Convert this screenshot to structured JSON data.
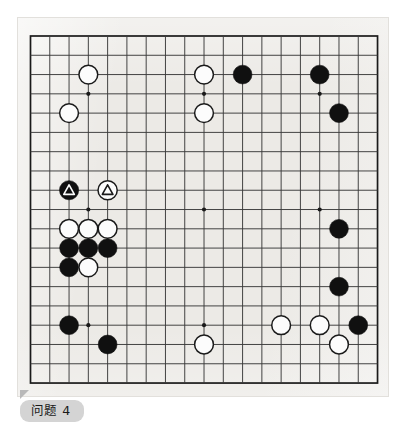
{
  "diagram": {
    "type": "go-board-problem",
    "caption": "问题 4",
    "board_size": 19,
    "colors": {
      "paper": "#eceae6",
      "line": "#3a3a3a",
      "border": "#1a1a1a",
      "black_stone": "#101010",
      "white_stone": "#fcfcfc",
      "white_stone_edge": "#1a1a1a",
      "caption_pill": "#d4d4d4",
      "caption_text": "#1a1a1a"
    },
    "geometry": {
      "origin_x": 30.5,
      "origin_y": 36.0,
      "step": 19.28,
      "stone_radius": 9.4,
      "marked_stone_radius": 9.6
    },
    "star_points": [
      {
        "col": 3,
        "row": 3
      },
      {
        "col": 9,
        "row": 3
      },
      {
        "col": 15,
        "row": 3
      },
      {
        "col": 3,
        "row": 9
      },
      {
        "col": 9,
        "row": 9
      },
      {
        "col": 15,
        "row": 9
      },
      {
        "col": 3,
        "row": 15
      },
      {
        "col": 9,
        "row": 15
      },
      {
        "col": 15,
        "row": 15
      }
    ],
    "stones": [
      {
        "id": "w-d17",
        "color": "white",
        "col": 3,
        "row": 2,
        "mark": null,
        "label": "White D17"
      },
      {
        "id": "w-c15",
        "color": "white",
        "col": 2,
        "row": 4,
        "mark": null,
        "label": "White C15"
      },
      {
        "id": "w-k17",
        "color": "white",
        "col": 9,
        "row": 2,
        "mark": null,
        "label": "White K17"
      },
      {
        "id": "b-m17",
        "color": "black",
        "col": 11,
        "row": 2,
        "mark": null,
        "label": "Black M17"
      },
      {
        "id": "w-k15",
        "color": "white",
        "col": 9,
        "row": 4,
        "mark": null,
        "label": "White K15"
      },
      {
        "id": "b-q17",
        "color": "black",
        "col": 15,
        "row": 2,
        "mark": null,
        "label": "Black Q17"
      },
      {
        "id": "b-r15",
        "color": "black",
        "col": 16,
        "row": 4,
        "mark": null,
        "label": "Black R15"
      },
      {
        "id": "b-c11-tri",
        "color": "black",
        "col": 2,
        "row": 8,
        "mark": "triangle",
        "label": "Black marked stone"
      },
      {
        "id": "w-e11-tri",
        "color": "white",
        "col": 4,
        "row": 8,
        "mark": "triangle",
        "label": "White marked stone"
      },
      {
        "id": "w-c9",
        "color": "white",
        "col": 2,
        "row": 10,
        "mark": null,
        "label": "White C9"
      },
      {
        "id": "w-d9",
        "color": "white",
        "col": 3,
        "row": 10,
        "mark": null,
        "label": "White D9"
      },
      {
        "id": "w-e9",
        "color": "white",
        "col": 4,
        "row": 10,
        "mark": null,
        "label": "White E9"
      },
      {
        "id": "b-c8",
        "color": "black",
        "col": 2,
        "row": 11,
        "mark": null,
        "label": "Black C8"
      },
      {
        "id": "b-d8",
        "color": "black",
        "col": 3,
        "row": 11,
        "mark": null,
        "label": "Black D8"
      },
      {
        "id": "b-e8",
        "color": "black",
        "col": 4,
        "row": 11,
        "mark": null,
        "label": "Black E8"
      },
      {
        "id": "b-c7",
        "color": "black",
        "col": 2,
        "row": 12,
        "mark": null,
        "label": "Black C7"
      },
      {
        "id": "w-d7",
        "color": "white",
        "col": 3,
        "row": 12,
        "mark": null,
        "label": "White D7"
      },
      {
        "id": "b-r9",
        "color": "black",
        "col": 16,
        "row": 10,
        "mark": null,
        "label": "Black R9"
      },
      {
        "id": "b-r6",
        "color": "black",
        "col": 16,
        "row": 13,
        "mark": null,
        "label": "Black R6"
      },
      {
        "id": "b-c4",
        "color": "black",
        "col": 2,
        "row": 15,
        "mark": null,
        "label": "Black C4"
      },
      {
        "id": "b-e3",
        "color": "black",
        "col": 4,
        "row": 16,
        "mark": null,
        "label": "Black E3"
      },
      {
        "id": "w-k3",
        "color": "white",
        "col": 9,
        "row": 16,
        "mark": null,
        "label": "White K3"
      },
      {
        "id": "w-o4",
        "color": "white",
        "col": 13,
        "row": 15,
        "mark": null,
        "label": "White O4"
      },
      {
        "id": "w-q4",
        "color": "white",
        "col": 15,
        "row": 15,
        "mark": null,
        "label": "White Q4"
      },
      {
        "id": "b-s4",
        "color": "black",
        "col": 17,
        "row": 15,
        "mark": null,
        "label": "Black S4"
      },
      {
        "id": "w-r3",
        "color": "white",
        "col": 16,
        "row": 16,
        "mark": null,
        "label": "White R3"
      }
    ]
  }
}
